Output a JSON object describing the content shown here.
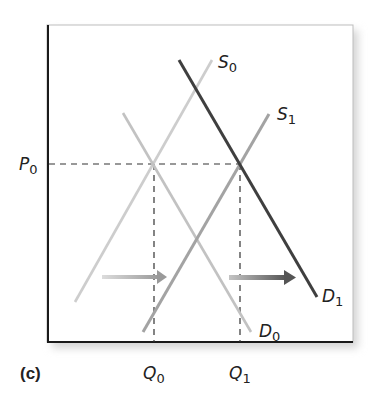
{
  "panel_label": "(c)",
  "axes": {
    "price_tick": {
      "main": "P",
      "sub": "0"
    },
    "quantity_ticks": [
      {
        "main": "Q",
        "sub": "0"
      },
      {
        "main": "Q",
        "sub": "1"
      }
    ]
  },
  "curves": {
    "S0": {
      "main": "S",
      "sub": "0",
      "color": "#c8c8c8"
    },
    "S1": {
      "main": "S",
      "sub": "1",
      "color": "#a0a0a0"
    },
    "D0": {
      "main": "D",
      "sub": "0",
      "color": "#c0c0c0"
    },
    "D1": {
      "main": "D",
      "sub": "1",
      "color": "#3f3f3f"
    }
  },
  "arrows": [
    {
      "name": "supply-shift-arrow",
      "direction": "right"
    },
    {
      "name": "demand-shift-arrow",
      "direction": "right"
    }
  ],
  "colors": {
    "axis": "#1a1a1a",
    "dashed": "#333333",
    "shadow": "#d9d9d9"
  }
}
